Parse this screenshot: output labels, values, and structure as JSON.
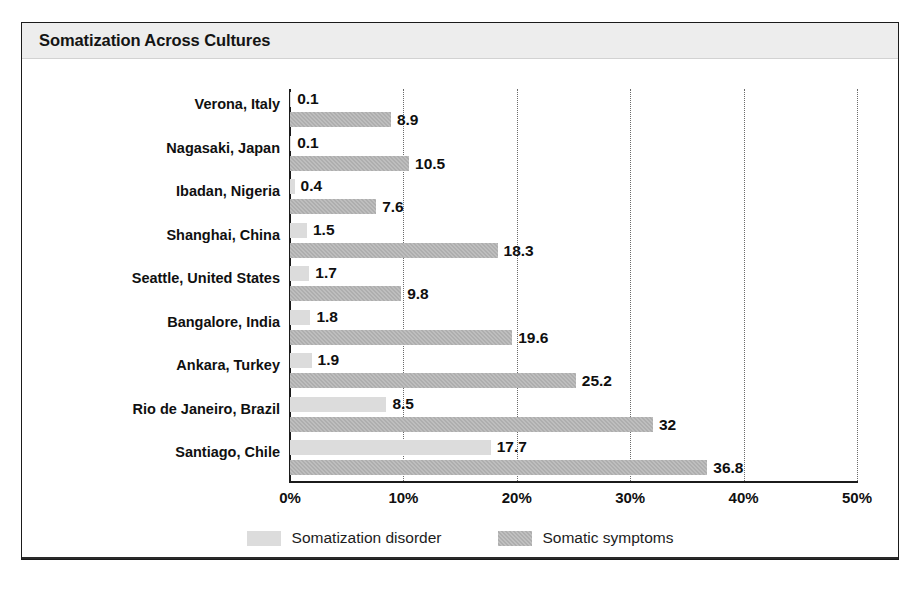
{
  "chart_data": {
    "type": "bar",
    "orientation": "horizontal",
    "title": "Somatization Across Cultures",
    "xlabel": "",
    "ylabel": "",
    "xlim": [
      0,
      50
    ],
    "xticks": [
      "0%",
      "10%",
      "20%",
      "30%",
      "40%",
      "50%"
    ],
    "xtick_values": [
      0,
      10,
      20,
      30,
      40,
      50
    ],
    "grid": "vertical-dotted",
    "legend_position": "bottom-center",
    "categories": [
      "Verona, Italy",
      "Nagasaki, Japan",
      "Ibadan, Nigeria",
      "Shanghai, China",
      "Seattle, United States",
      "Bangalore, India",
      "Ankara, Turkey",
      "Rio de Janeiro, Brazil",
      "Santiago, Chile"
    ],
    "series": [
      {
        "name": "Somatization disorder",
        "color": "#dcdcdc",
        "values": [
          0.1,
          0.1,
          0.4,
          1.5,
          1.7,
          1.8,
          1.9,
          8.5,
          17.7
        ],
        "labels": [
          "0.1",
          "0.1",
          "0.4",
          "1.5",
          "1.7",
          "1.8",
          "1.9",
          "8.5",
          "17.7"
        ]
      },
      {
        "name": "Somatic symptoms",
        "color": "#aeaeae",
        "values": [
          8.9,
          10.5,
          7.6,
          18.3,
          9.8,
          19.6,
          25.2,
          32,
          36.8
        ],
        "labels": [
          "8.9",
          "10.5",
          "7.6",
          "18.3",
          "9.8",
          "19.6",
          "25.2",
          "32",
          "36.8"
        ]
      }
    ]
  },
  "colors": {
    "header_band": "#ededed",
    "frame": "#1b1b1b",
    "series_light": "#dcdcdc",
    "series_dark": "#aeaeae",
    "text": "#101010"
  }
}
